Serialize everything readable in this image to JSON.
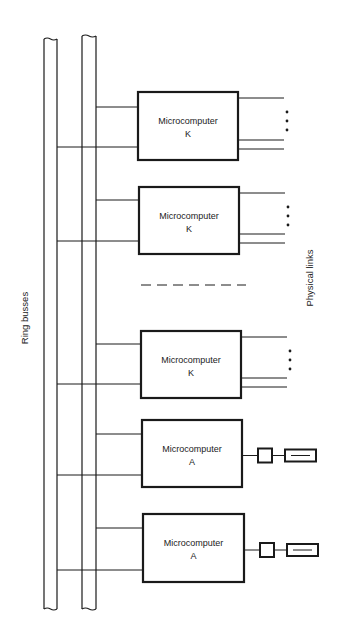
{
  "diagram": {
    "labels": {
      "ring_busses": "Ring busses",
      "physical_links": "Physical links"
    },
    "colors": {
      "stroke": "#1a1a1a",
      "background": "#ffffff"
    },
    "buses": [
      {
        "name": "ring-bus-1",
        "x1": 44,
        "x2": 57,
        "y_top": 37,
        "y_bottom": 609
      },
      {
        "name": "ring-bus-2",
        "x1": 82,
        "x2": 96,
        "y_top": 34,
        "y_bottom": 609
      }
    ],
    "microcomputers": [
      {
        "title": "Microcomputer",
        "id": "K",
        "type": "K",
        "x": 138,
        "y": 92,
        "w": 100,
        "h": 68,
        "link_top": 107,
        "link_bottom": 147
      },
      {
        "title": "Microcomputer",
        "id": "K",
        "type": "K",
        "x": 139,
        "y": 187,
        "w": 100,
        "h": 67,
        "link_top": 200,
        "link_bottom": 241
      },
      {
        "title": "Microcomputer",
        "id": "K",
        "type": "K",
        "x": 141,
        "y": 331,
        "w": 100,
        "h": 67,
        "link_top": 344,
        "link_bottom": 384
      },
      {
        "title": "Microcomputer",
        "id": "A",
        "type": "A",
        "x": 142,
        "y": 420,
        "w": 100,
        "h": 67,
        "link_top": 434,
        "link_bottom": 475
      },
      {
        "title": "Microcomputer",
        "id": "A",
        "type": "A",
        "x": 143,
        "y": 514,
        "w": 101,
        "h": 68,
        "link_top": 528,
        "link_bottom": 570
      }
    ],
    "ellipsis_separator": {
      "y": 285,
      "x1": 141,
      "x2": 246
    }
  }
}
